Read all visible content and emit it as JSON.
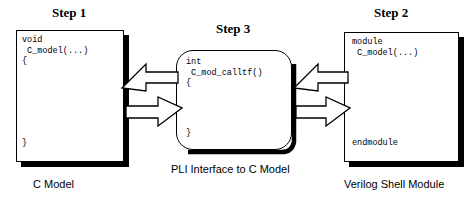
{
  "titles": {
    "step1": "Step 1",
    "step2": "Step 2",
    "step3": "Step 3"
  },
  "captions": {
    "left": "C Model",
    "center": "PLI Interface to C Model",
    "right": "Verilog Shell Module"
  },
  "boxes": {
    "left": {
      "name": "c-model-box",
      "code_top": "void\n C_model(...)\n{",
      "code_bottom": "}"
    },
    "center": {
      "name": "pli-interface-box",
      "code_top": "int\n C_mod_calltf()\n{",
      "code_bottom": "}"
    },
    "right": {
      "name": "verilog-shell-box",
      "code_top": "module\n C_model(...)",
      "code_bottom": "endmodule"
    }
  },
  "arrows": {
    "left_upper_direction": "left",
    "left_lower_direction": "right",
    "right_upper_direction": "left",
    "right_lower_direction": "right"
  },
  "colors": {
    "stroke": "#000000",
    "fill": "#ffffff",
    "background": "#ffffff"
  }
}
